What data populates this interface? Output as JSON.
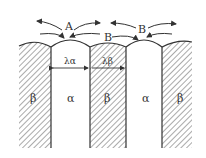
{
  "diagram": {
    "title": "",
    "diffusion_labels": {
      "top_left": "A",
      "top_right": "B",
      "middle": "B"
    },
    "phases": [
      {
        "name": "β",
        "type": "hatched"
      },
      {
        "name": "α",
        "type": "plain"
      },
      {
        "name": "β",
        "type": "hatched"
      },
      {
        "name": "α",
        "type": "plain"
      },
      {
        "name": "β",
        "type": "hatched"
      }
    ],
    "spacing_labels": {
      "alpha": "λα",
      "beta": "λβ"
    },
    "colors": {
      "line": "#333333",
      "background": "#ffffff"
    }
  }
}
